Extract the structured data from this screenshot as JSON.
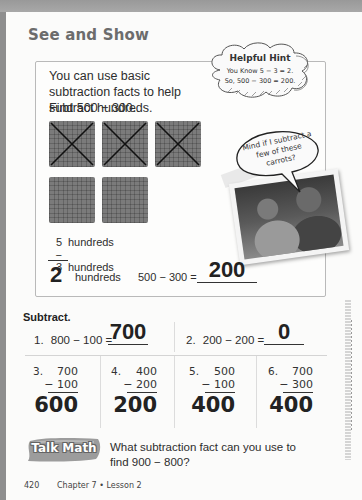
{
  "page": {
    "section_title": "See and Show",
    "colors": {
      "background_border": "#8e8e8e",
      "page": "#fbfbfa",
      "title_gray": "#6c6c6c",
      "block_fill": "#7b7b7b",
      "text": "#2d2d2d"
    }
  },
  "intro": {
    "text": "You can use basic subtraction facts to help subtract hundreds.",
    "find": "Find 500 − 300."
  },
  "hint": {
    "title": "Helpful Hint",
    "line1": "You Know 5 − 3 = 2.",
    "line2": "So, 500 − 300 = 200."
  },
  "blocks": {
    "crossed_out": 3,
    "remaining": 2,
    "total": 5
  },
  "speech_bubble": {
    "text": "Mind if I subtract a few of these carrots?"
  },
  "worked_example": {
    "row1_num": "5",
    "row1_word": "hundreds",
    "row2_num": "− 3",
    "row2_word": "hundreds",
    "result_num": "2",
    "result_word": "hundreds",
    "equation": "500 − 300 =",
    "answer": "200"
  },
  "exercises": {
    "instruction": "Subtract.",
    "horizontal": [
      {
        "number": "1.",
        "problem": "800 − 100 =",
        "answer": "700"
      },
      {
        "number": "2.",
        "problem": "200 − 200 =",
        "answer": "0"
      }
    ],
    "vertical": [
      {
        "number": "3.",
        "top": "700",
        "bottom": "− 100",
        "answer": "600"
      },
      {
        "number": "4.",
        "top": "400",
        "bottom": "− 200",
        "answer": "200"
      },
      {
        "number": "5.",
        "top": "500",
        "bottom": "− 100",
        "answer": "400"
      },
      {
        "number": "6.",
        "top": "700",
        "bottom": "− 300",
        "answer": "400"
      }
    ]
  },
  "talk_math": {
    "label": "Talk Math",
    "question": "What subtraction fact can you use to find 900 − 800?"
  },
  "footer": {
    "page_number": "420",
    "chapter": "Chapter 7 • Lesson 2"
  }
}
